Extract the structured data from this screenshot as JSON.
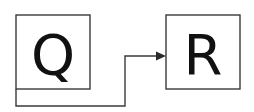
{
  "diagram": {
    "nodes": [
      {
        "id": "Q",
        "label": "Q"
      },
      {
        "id": "R",
        "label": "R"
      }
    ],
    "edges": [
      {
        "from": "Q",
        "to": "R",
        "style": "elbow-connector-with-arrow"
      }
    ],
    "colors": {
      "stroke": "#3a3a3a",
      "text": "#111111",
      "background": "#ffffff"
    }
  }
}
